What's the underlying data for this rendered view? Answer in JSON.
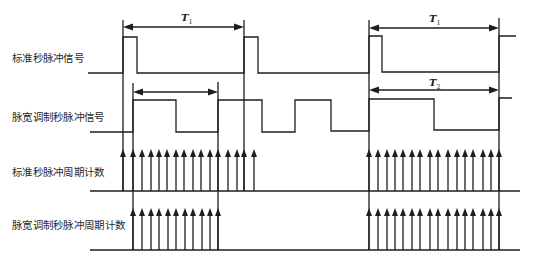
{
  "row_labels": {
    "standard_pps_signal": "标准秒脉冲信号",
    "pwm_pps_signal": "脉宽调制秒脉冲信号",
    "standard_pps_period_count": "标准秒脉冲周期计数",
    "pwm_pps_period_count": "脉宽调制秒脉冲周期计数"
  },
  "row_label_positions": {
    "standard_pps_signal": 52,
    "pwm_pps_signal": 111,
    "standard_pps_period_count": 166,
    "pwm_pps_period_count": 219
  },
  "diagram": {
    "stroke_color": "#1e1e1e",
    "waveforms": [
      {
        "name": "standard-pps-waveform",
        "points": [
          [
            88,
            73
          ],
          [
            123,
            73
          ],
          [
            123,
            37
          ],
          [
            137,
            37
          ],
          [
            137,
            73
          ],
          [
            244,
            73
          ],
          [
            244,
            37
          ],
          [
            258,
            37
          ],
          [
            258,
            73
          ],
          [
            369,
            73
          ],
          [
            369,
            36
          ],
          [
            382,
            36
          ],
          [
            382,
            72
          ],
          [
            499,
            72
          ],
          [
            499,
            36
          ],
          [
            516,
            36
          ]
        ]
      },
      {
        "name": "pwm-pps-waveform",
        "points": [
          [
            90,
            132
          ],
          [
            133,
            132
          ],
          [
            133,
            100
          ],
          [
            176,
            100
          ],
          [
            176,
            132
          ],
          [
            218,
            132
          ],
          [
            218,
            100
          ],
          [
            262,
            100
          ],
          [
            262,
            132
          ],
          [
            295,
            132
          ],
          [
            295,
            100
          ],
          [
            331,
            100
          ],
          [
            331,
            131
          ],
          [
            369,
            131
          ],
          [
            369,
            99
          ],
          [
            434,
            99
          ],
          [
            434,
            130
          ],
          [
            499,
            130
          ],
          [
            499,
            98
          ],
          [
            512,
            98
          ]
        ]
      }
    ],
    "reference_lines": [
      {
        "x": 123,
        "y1": 20,
        "y2": 191
      },
      {
        "x": 244,
        "y1": 20,
        "y2": 191
      },
      {
        "x": 133,
        "y1": 83,
        "y2": 250
      },
      {
        "x": 218,
        "y1": 82,
        "y2": 250
      },
      {
        "x": 369,
        "y1": 20,
        "y2": 250
      },
      {
        "x": 499,
        "y1": 18,
        "y2": 250
      }
    ],
    "dimension_arrows": [
      {
        "name": "period-t1-left",
        "x1": 123,
        "x2": 244,
        "y": 27,
        "symbol": "T",
        "subscript": "1",
        "label_x": 181,
        "label_y": 21
      },
      {
        "name": "pwm-width-left",
        "x1": 133,
        "x2": 218,
        "y": 92,
        "symbol": "",
        "subscript": "",
        "label_x": 0,
        "label_y": 0
      },
      {
        "name": "period-t1-right",
        "x1": 369,
        "x2": 499,
        "y": 28,
        "symbol": "T",
        "subscript": "1",
        "label_x": 429,
        "label_y": 22
      },
      {
        "name": "period-t2-right",
        "x1": 369,
        "x2": 499,
        "y": 90,
        "symbol": "T",
        "subscript": "2",
        "label_x": 429,
        "label_y": 86
      }
    ],
    "count_rows": [
      {
        "name": "standard-pps-count-row",
        "baseline_y": 191,
        "x1": 90,
        "x2": 520,
        "tip_y": 149,
        "arrows_x": [
          123,
          133,
          142,
          151,
          159,
          167,
          176,
          184,
          193,
          201,
          210,
          218,
          228,
          237,
          244,
          254,
          369,
          378,
          387,
          395,
          403,
          412,
          420,
          430,
          438,
          448,
          457,
          465,
          473,
          483,
          491,
          499
        ]
      },
      {
        "name": "pwm-pps-count-row",
        "baseline_y": 250,
        "x1": 90,
        "x2": 520,
        "tip_y": 208,
        "arrows_x": [
          133,
          142,
          151,
          159,
          168,
          176,
          185,
          193,
          202,
          210,
          218,
          369,
          378,
          387,
          395,
          403,
          412,
          420,
          430,
          438,
          448,
          457,
          465,
          473,
          483,
          491,
          499
        ]
      }
    ]
  }
}
